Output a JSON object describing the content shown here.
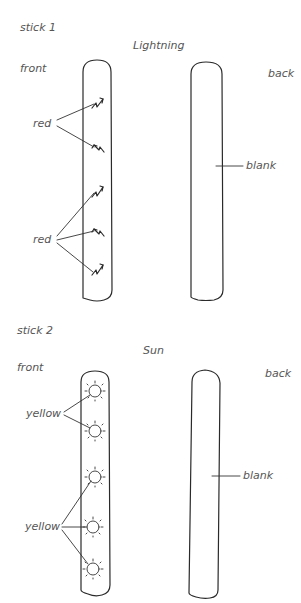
{
  "sticks": [
    {
      "label": "stick 1",
      "theme": "Lightning",
      "front_label": "front",
      "back_label": "back",
      "front_callouts": [
        {
          "label": "red",
          "count": 2
        },
        {
          "label": "red",
          "count": 3
        }
      ],
      "back_callout": "blank"
    },
    {
      "label": "stick 2",
      "theme": "Sun",
      "front_label": "front",
      "back_label": "back",
      "front_callouts": [
        {
          "label": "yellow",
          "count": 2
        },
        {
          "label": "yellow",
          "count": 3
        }
      ],
      "back_callout": "blank"
    }
  ],
  "colors": {
    "line": "#2a2a2a",
    "text": "#555555",
    "background": "#ffffff"
  }
}
